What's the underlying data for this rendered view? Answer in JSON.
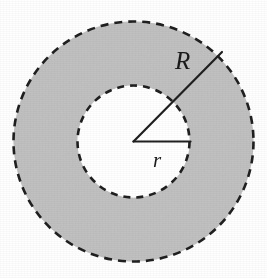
{
  "figure": {
    "kind": "annulus-diagram",
    "caption": "",
    "background_color": "#fefefe"
  },
  "labels": {
    "outer_radius": "R",
    "inner_radius": "r"
  },
  "geometry": {
    "center": {
      "x": 133.5,
      "y": 141.5
    },
    "outer_circle": {
      "radius": 120,
      "stroke_color": "#1f1f1f",
      "stroke_width": 2.4,
      "dash": "8 6",
      "style": "dashed"
    },
    "inner_circle": {
      "radius": 56,
      "stroke_color": "#1f1f1f",
      "stroke_width": 2.4,
      "dash": "7 6",
      "style": "dashed"
    },
    "ring_fill_color": "#c9c9c9",
    "hole_fill_color": "#ffffff",
    "radius_line_outer": {
      "from": {
        "x": 133.5,
        "y": 141.5
      },
      "to": {
        "x": 222,
        "y": 52
      },
      "angle_degrees": 45,
      "stroke_color": "#1f1f1f",
      "stroke_width": 2.2
    },
    "radius_line_inner": {
      "from": {
        "x": 133.5,
        "y": 141.5
      },
      "to": {
        "x": 190,
        "y": 141.5
      },
      "angle_degrees": 0,
      "stroke_color": "#1f1f1f",
      "stroke_width": 2.2
    }
  }
}
